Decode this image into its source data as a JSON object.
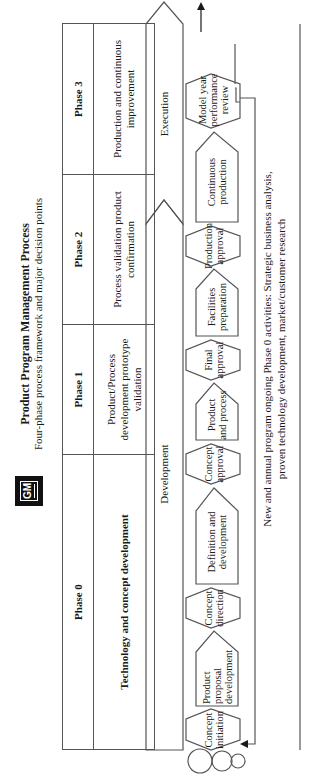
{
  "header": {
    "logo_text": "GM",
    "title": "Product Program Management Process",
    "subtitle": "Four-phase process framework and major decision points"
  },
  "phases": [
    {
      "name": "Phase 0",
      "description": "Technology and concept development"
    },
    {
      "name": "Phase 1",
      "description": "Product/Process development prototype validation"
    },
    {
      "name": "Phase 2",
      "description": "Process validation product confirmation"
    },
    {
      "name": "Phase 3",
      "description": "Production and continuous improvement"
    }
  ],
  "stages": {
    "development": "Development",
    "execution": "Execution"
  },
  "process_steps": [
    {
      "type": "decision",
      "label": "Concept initiation"
    },
    {
      "type": "activity",
      "label": "Product proposal development"
    },
    {
      "type": "decision",
      "label": "Concept direction"
    },
    {
      "type": "activity",
      "label": "Definition and development"
    },
    {
      "type": "decision",
      "label": "Concept approval"
    },
    {
      "type": "activity",
      "label": "Product and process"
    },
    {
      "type": "decision",
      "label": "Final approval"
    },
    {
      "type": "activity",
      "label": "Facilities preparation"
    },
    {
      "type": "decision",
      "label": "Production approval"
    },
    {
      "type": "activity",
      "label": "Continuous production"
    },
    {
      "type": "decision",
      "label": "Model year performance review"
    }
  ],
  "footer_note": {
    "line1": "New and annual program ongoing Phase 0 activities:  Strategic business analysis,",
    "line2": "proven technology development, market/customer research"
  },
  "colors": {
    "line": "#555555",
    "text": "#1a1a1a",
    "logo": "#111111"
  }
}
